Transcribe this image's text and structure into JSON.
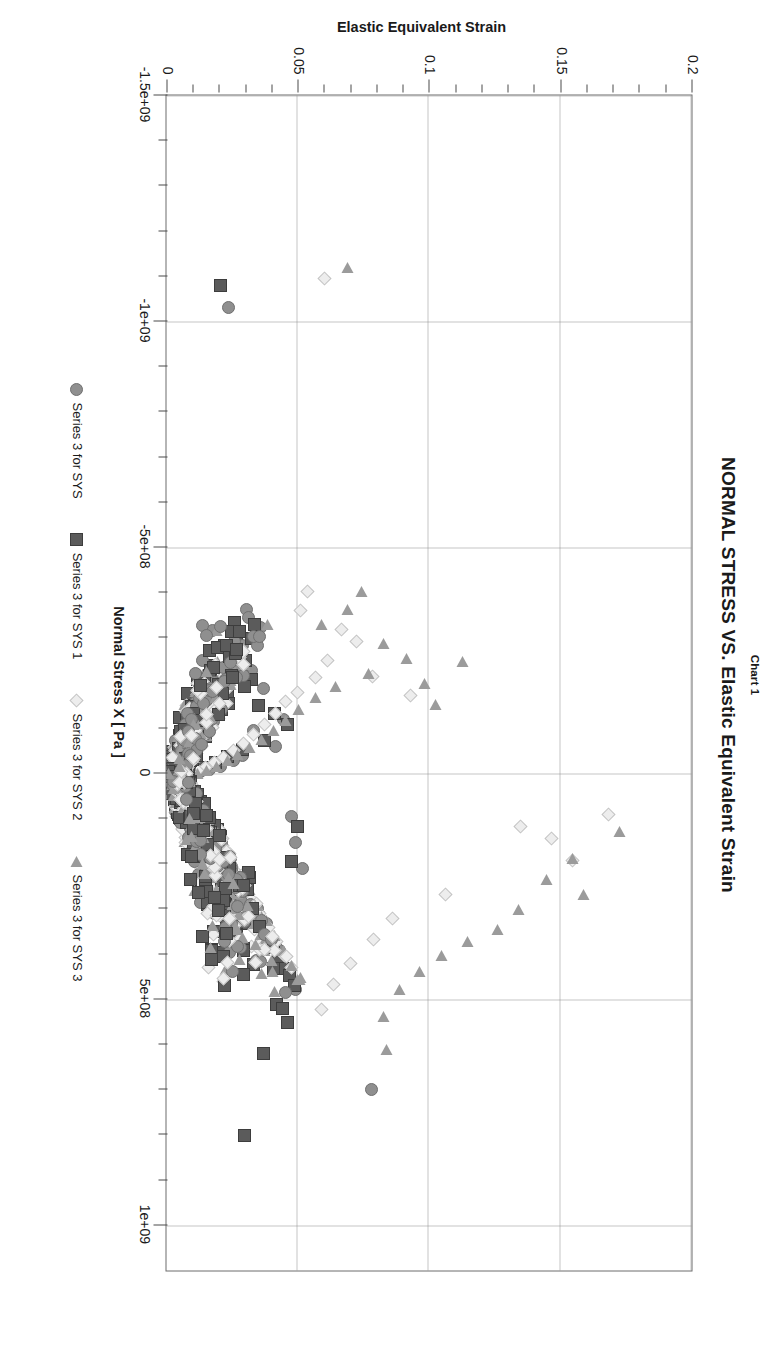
{
  "header": {
    "chart_label": "Chart 1",
    "title": "NORMAL STRESS VS. Elastic Equivalent Strain"
  },
  "colors": {
    "series_sys": "#8f8f8f",
    "series_sys1": "#5b5b5b",
    "series_sys2": "#ededed",
    "series_sys3": "#9b9b9b",
    "grid": "#8a8a8a",
    "frame": "#6d6d6d",
    "text": "#1a1a1a"
  },
  "chart_data": {
    "type": "scatter",
    "title": "NORMAL STRESS VS. Elastic Equivalent Strain",
    "subtitle": "Chart 1",
    "xlabel": "Normal Stress X [ Pa ]",
    "ylabel": "Elastic Equivalent Strain",
    "xlim": [
      -1500000000,
      1100000000
    ],
    "ylim": [
      0,
      0.2
    ],
    "xticks": [
      -1500000000,
      -1000000000,
      -500000000,
      0,
      500000000,
      1000000000
    ],
    "xticklabels": [
      "-1.5e+09",
      "-1e+09",
      "-5e+08",
      "0",
      "5e+08",
      "1e+09"
    ],
    "yticks": [
      0,
      0.05,
      0.1,
      0.15,
      0.2
    ],
    "yticklabels": [
      "0",
      "0.05",
      "0.1",
      "0.15",
      "0.2"
    ],
    "grid": true,
    "grid_style": "dotted",
    "legend_position": "bottom",
    "minor_ticks_per_interval": 5,
    "series": [
      {
        "name": "Series 3 for SYS",
        "marker": "circle",
        "color": "#8f8f8f",
        "points": [
          [
            -1030000000,
            0.0235
          ],
          [
            -228000000,
            0.0322
          ],
          [
            -188000000,
            0.0368
          ],
          [
            -120000000,
            0.0445
          ],
          [
            -96000000,
            0.033
          ],
          [
            -60000000,
            0.0415
          ],
          [
            -40000000,
            0.029
          ],
          [
            -28000000,
            0.0255
          ],
          [
            -15000000,
            0.0205
          ],
          [
            -8000000,
            0.0165
          ],
          [
            -4000000,
            0.0128
          ],
          [
            0,
            0.0098
          ],
          [
            4000000,
            0.0078
          ],
          [
            9000000,
            0.0062
          ],
          [
            16000000,
            0.005
          ],
          [
            24000000,
            0.0042
          ],
          [
            35000000,
            0.0058
          ],
          [
            48000000,
            0.0075
          ],
          [
            62000000,
            0.0092
          ],
          [
            80000000,
            0.0112
          ],
          [
            100000000,
            0.0138
          ],
          [
            125000000,
            0.0165
          ],
          [
            150000000,
            0.0188
          ],
          [
            178000000,
            0.0215
          ],
          [
            205000000,
            0.0248
          ],
          [
            232000000,
            0.0278
          ],
          [
            268000000,
            0.0305
          ],
          [
            300000000,
            0.0345
          ],
          [
            332000000,
            0.0382
          ],
          [
            372000000,
            0.0398
          ],
          [
            380000000,
            0.0415
          ],
          [
            392000000,
            0.0432
          ],
          [
            432000000,
            0.0465
          ],
          [
            478000000,
            0.0492
          ],
          [
            700000000,
            0.0782
          ],
          [
            210000000,
            0.052
          ],
          [
            152000000,
            0.0492
          ],
          [
            96000000,
            0.0478
          ]
        ]
      },
      {
        "name": "Series 3 for SYS 1",
        "marker": "square",
        "color": "#5b5b5b",
        "points": [
          [
            -1080000000,
            0.0205
          ],
          [
            -288000000,
            0.0265
          ],
          [
            -250000000,
            0.0302
          ],
          [
            -208000000,
            0.0325
          ],
          [
            -192000000,
            0.0298
          ],
          [
            -150000000,
            0.0352
          ],
          [
            -132000000,
            0.041
          ],
          [
            -108000000,
            0.0462
          ],
          [
            -72000000,
            0.0372
          ],
          [
            -52000000,
            0.0288
          ],
          [
            -38000000,
            0.0232
          ],
          [
            -24000000,
            0.0188
          ],
          [
            -12000000,
            0.0142
          ],
          [
            -5000000,
            0.0108
          ],
          [
            0,
            0.0085
          ],
          [
            6000000,
            0.0068
          ],
          [
            14000000,
            0.0055
          ],
          [
            25000000,
            0.0048
          ],
          [
            38000000,
            0.0062
          ],
          [
            52000000,
            0.008
          ],
          [
            70000000,
            0.0098
          ],
          [
            90000000,
            0.012
          ],
          [
            115000000,
            0.0148
          ],
          [
            140000000,
            0.0175
          ],
          [
            168000000,
            0.0202
          ],
          [
            196000000,
            0.0228
          ],
          [
            225000000,
            0.0262
          ],
          [
            255000000,
            0.0292
          ],
          [
            290000000,
            0.032
          ],
          [
            318000000,
            0.0352
          ],
          [
            352000000,
            0.0382
          ],
          [
            385000000,
            0.0408
          ],
          [
            405000000,
            0.0428
          ],
          [
            432000000,
            0.0448
          ],
          [
            448000000,
            0.0468
          ],
          [
            470000000,
            0.0488
          ],
          [
            512000000,
            0.0418
          ],
          [
            520000000,
            0.0442
          ],
          [
            552000000,
            0.0462
          ],
          [
            620000000,
            0.0368
          ],
          [
            802000000,
            0.0298
          ],
          [
            196000000,
            0.0478
          ],
          [
            118000000,
            0.0498
          ]
        ]
      },
      {
        "name": "Series 3 for SYS 2",
        "marker": "diamond",
        "color": "#ededed",
        "points": [
          [
            -1095000000,
            0.0602
          ],
          [
            -402000000,
            0.0538
          ],
          [
            -360000000,
            0.0512
          ],
          [
            -318000000,
            0.0668
          ],
          [
            -292000000,
            0.0722
          ],
          [
            -250000000,
            0.0615
          ],
          [
            -212000000,
            0.0568
          ],
          [
            -180000000,
            0.0498
          ],
          [
            -158000000,
            0.0452
          ],
          [
            -132000000,
            0.0415
          ],
          [
            -108000000,
            0.0372
          ],
          [
            -86000000,
            0.0332
          ],
          [
            -66000000,
            0.0292
          ],
          [
            -50000000,
            0.0255
          ],
          [
            -36000000,
            0.0218
          ],
          [
            -24000000,
            0.0182
          ],
          [
            -14000000,
            0.0148
          ],
          [
            -6000000,
            0.0118
          ],
          [
            0,
            0.0092
          ],
          [
            8000000,
            0.0072
          ],
          [
            18000000,
            0.006
          ],
          [
            30000000,
            0.0055
          ],
          [
            45000000,
            0.007
          ],
          [
            62000000,
            0.009
          ],
          [
            82000000,
            0.0112
          ],
          [
            105000000,
            0.014
          ],
          [
            130000000,
            0.0168
          ],
          [
            158000000,
            0.0198
          ],
          [
            188000000,
            0.0228
          ],
          [
            215000000,
            0.0258
          ],
          [
            245000000,
            0.0288
          ],
          [
            278000000,
            0.0322
          ],
          [
            310000000,
            0.0355
          ],
          [
            342000000,
            0.0388
          ],
          [
            372000000,
            0.0418
          ],
          [
            402000000,
            0.0448
          ],
          [
            430000000,
            0.0478
          ],
          [
            118000000,
            0.1348
          ],
          [
            145000000,
            0.1468
          ],
          [
            192000000,
            0.1545
          ],
          [
            268000000,
            0.1062
          ],
          [
            322000000,
            0.0862
          ],
          [
            368000000,
            0.0788
          ],
          [
            420000000,
            0.0702
          ],
          [
            468000000,
            0.0638
          ],
          [
            522000000,
            0.0592
          ],
          [
            92000000,
            0.1685
          ],
          [
            -172000000,
            0.0928
          ],
          [
            -215000000,
            0.0785
          ]
        ]
      },
      {
        "name": "Series 3 for SYS 3",
        "marker": "triangle",
        "color": "#9b9b9b",
        "points": [
          [
            -1120000000,
            0.0688
          ],
          [
            -402000000,
            0.0742
          ],
          [
            -362000000,
            0.0688
          ],
          [
            -330000000,
            0.0592
          ],
          [
            -288000000,
            0.0825
          ],
          [
            -255000000,
            0.0915
          ],
          [
            -222000000,
            0.0768
          ],
          [
            -192000000,
            0.0645
          ],
          [
            -168000000,
            0.0568
          ],
          [
            -142000000,
            0.0502
          ],
          [
            -118000000,
            0.0452
          ],
          [
            -95000000,
            0.0408
          ],
          [
            -75000000,
            0.0362
          ],
          [
            -58000000,
            0.0318
          ],
          [
            -42000000,
            0.0272
          ],
          [
            -28000000,
            0.0232
          ],
          [
            -16000000,
            0.0192
          ],
          [
            -7000000,
            0.0152
          ],
          [
            0,
            0.0118
          ],
          [
            9000000,
            0.0095
          ],
          [
            20000000,
            0.0078
          ],
          [
            34000000,
            0.0072
          ],
          [
            50000000,
            0.0088
          ],
          [
            68000000,
            0.0108
          ],
          [
            88000000,
            0.0132
          ],
          [
            112000000,
            0.016
          ],
          [
            138000000,
            0.019
          ],
          [
            165000000,
            0.022
          ],
          [
            195000000,
            0.0252
          ],
          [
            225000000,
            0.0282
          ],
          [
            258000000,
            0.0315
          ],
          [
            292000000,
            0.0348
          ],
          [
            325000000,
            0.0382
          ],
          [
            358000000,
            0.0412
          ],
          [
            392000000,
            0.0445
          ],
          [
            425000000,
            0.0475
          ],
          [
            455000000,
            0.0505
          ],
          [
            128000000,
            0.1725
          ],
          [
            188000000,
            0.1545
          ],
          [
            235000000,
            0.1448
          ],
          [
            268000000,
            0.1588
          ],
          [
            302000000,
            0.1342
          ],
          [
            345000000,
            0.1262
          ],
          [
            372000000,
            0.1145
          ],
          [
            402000000,
            0.1048
          ],
          [
            438000000,
            0.0962
          ],
          [
            478000000,
            0.0888
          ],
          [
            538000000,
            0.0825
          ],
          [
            612000000,
            0.0838
          ],
          [
            -152000000,
            0.1025
          ],
          [
            -198000000,
            0.0982
          ],
          [
            -248000000,
            0.1128
          ]
        ]
      }
    ]
  },
  "legend": [
    {
      "label": "Series 3 for SYS",
      "marker": "circle"
    },
    {
      "label": "Series 3 for SYS 1",
      "marker": "square"
    },
    {
      "label": "Series 3 for SYS 2",
      "marker": "diamond"
    },
    {
      "label": "Series 3 for SYS 3",
      "marker": "triangle"
    }
  ]
}
